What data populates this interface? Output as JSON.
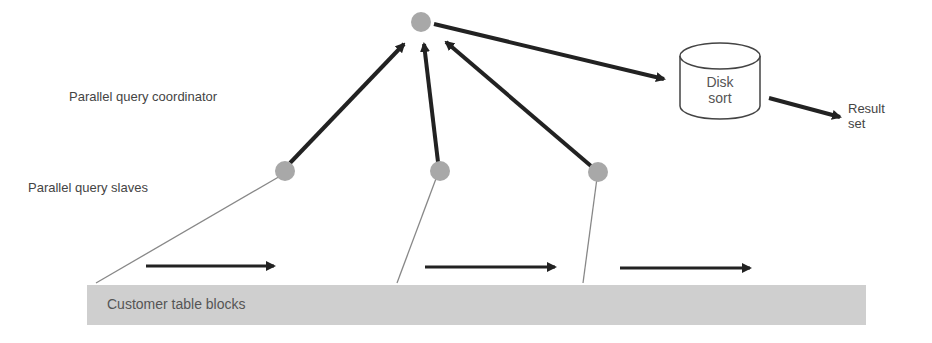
{
  "labels": {
    "coordinator": "Parallel query coordinator",
    "slaves": "Parallel query slaves",
    "table": "Customer table blocks",
    "disk_line1": "Disk",
    "disk_line2": "sort",
    "result_line1": "Result",
    "result_line2": "set"
  },
  "colors": {
    "node_fill": "#a8a8a8",
    "arrow": "#222222",
    "thin_line": "#888888",
    "table_fill": "#cfcfcf"
  }
}
